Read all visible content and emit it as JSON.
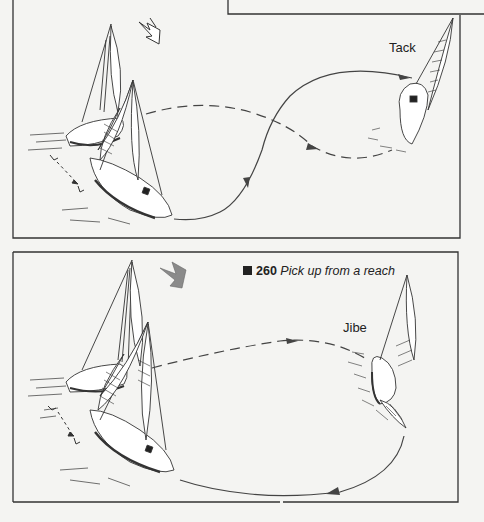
{
  "page": {
    "type": "illustrated book page",
    "colors": {
      "paper": "#f4f4f2",
      "ink": "#222222",
      "wind_arrow_fill": "#8a8a8a"
    }
  },
  "figure_top": {
    "maneuver_label": "Tack",
    "wind_arrow_icon": "wind-direction-arrow-outline",
    "elements": [
      "sailboat-pickup-position",
      "sailboat-tacking",
      "person-overboard",
      "dashed-course",
      "solid-return-course"
    ]
  },
  "figure_bottom": {
    "caption": {
      "marker": "■",
      "number": "260",
      "title": "Pick up from a reach"
    },
    "maneuver_label": "Jibe",
    "wind_arrow_icon": "wind-direction-arrow-filled",
    "elements": [
      "sailboat-pickup-position",
      "sailboat-jibing",
      "person-overboard",
      "dashed-course",
      "solid-return-course"
    ]
  }
}
